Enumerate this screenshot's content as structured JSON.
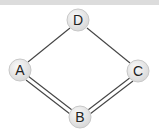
{
  "diagram": {
    "type": "graph",
    "nodes": [
      {
        "id": "D",
        "label": "D",
        "x": 78,
        "y": 20
      },
      {
        "id": "A",
        "label": "A",
        "x": 20,
        "y": 70
      },
      {
        "id": "C",
        "label": "C",
        "x": 138,
        "y": 71
      },
      {
        "id": "B",
        "label": "B",
        "x": 80,
        "y": 117
      }
    ],
    "edges": [
      {
        "from": "A",
        "to": "D",
        "style": "single"
      },
      {
        "from": "D",
        "to": "C",
        "style": "single"
      },
      {
        "from": "A",
        "to": "B",
        "style": "double"
      },
      {
        "from": "B",
        "to": "C",
        "style": "double"
      }
    ],
    "colors": {
      "node_fill": "#e8e8e8",
      "node_stroke": "#c8c8c8",
      "edge": "#444444",
      "label": "#222222"
    }
  }
}
